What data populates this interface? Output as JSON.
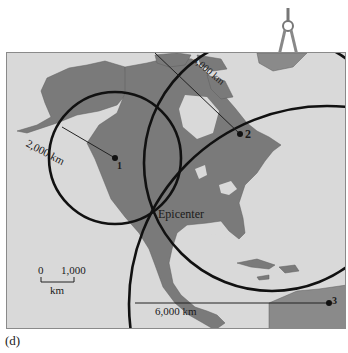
{
  "figure": {
    "panel_label": "(d)",
    "epicenter_label": "Epicenter",
    "stations": [
      {
        "id": "1",
        "label": "1",
        "radius_label": "2,000 km"
      },
      {
        "id": "2",
        "label": "2",
        "radius_label": "4,000 km"
      },
      {
        "id": "3",
        "label": "3",
        "radius_label": "6,000 km"
      }
    ],
    "scale_bar": {
      "start": "0",
      "end": "1,000",
      "unit": "km"
    },
    "icons": [
      "compass-drawing-tool-icon"
    ],
    "colors": {
      "ocean": "#d9d9d9",
      "land": "#7a7a7a",
      "circle": "#111111",
      "frame": "#8a8a8a"
    }
  }
}
